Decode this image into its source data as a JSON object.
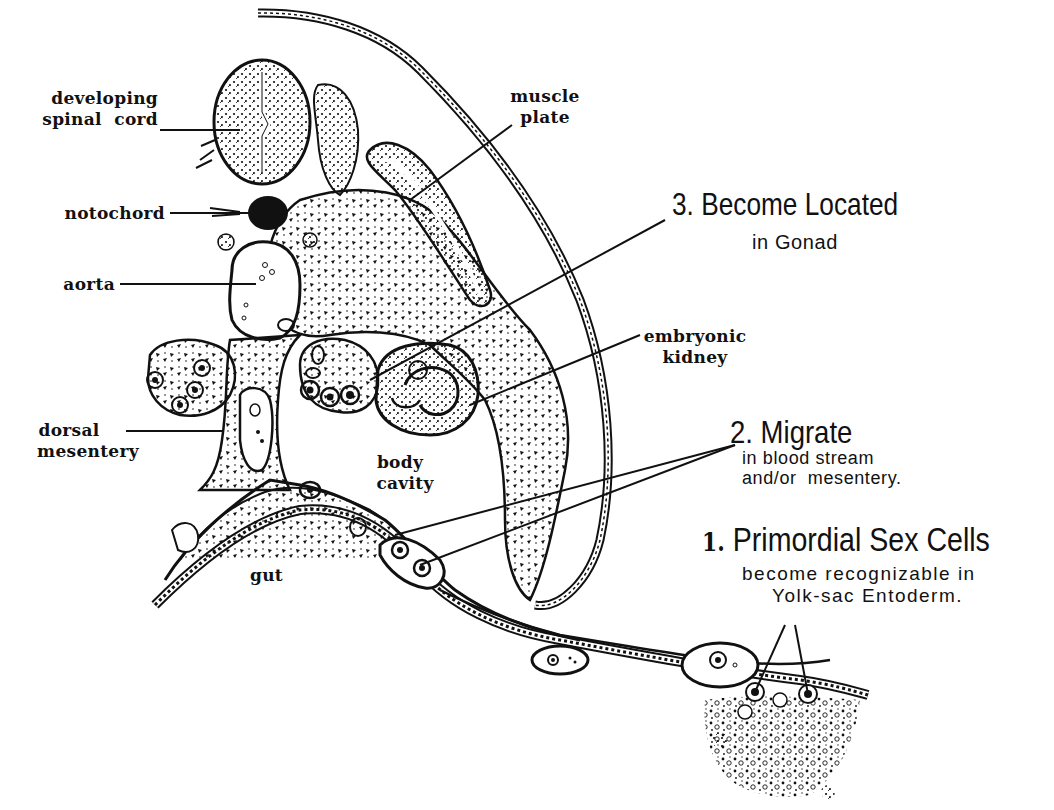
{
  "figure": {
    "colors": {
      "ink": "#111111",
      "paper": "#ffffff"
    }
  },
  "anatomy_labels": {
    "developing_spinal_cord": {
      "line1": "developing",
      "line2": "spinal  cord"
    },
    "notochord": "notochord",
    "aorta": "aorta",
    "dorsal_mesentery": {
      "line1": "dorsal",
      "line2": "mesentery"
    },
    "muscle_plate": {
      "line1": "muscle",
      "line2": "plate"
    },
    "embryonic_kidney": {
      "line1": "embryonic",
      "line2": "kidney"
    },
    "body_cavity": {
      "line1": "body",
      "line2": "cavity"
    },
    "gut": "gut"
  },
  "steps": [
    {
      "number": "1.",
      "title": "Primordial Sex Cells",
      "line2": "become recognizable in",
      "line3": "Yolk-sac Entoderm."
    },
    {
      "number": "2.",
      "title": "Migrate",
      "line2": "in blood stream",
      "line3": "and/or  mesentery."
    },
    {
      "number": "3.",
      "title": "Become Located",
      "line2": "in Gonad"
    }
  ]
}
